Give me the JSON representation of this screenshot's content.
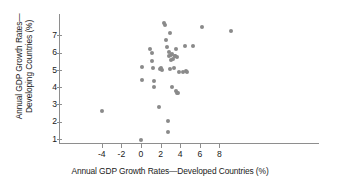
{
  "chart_data": {
    "type": "scatter",
    "title": "",
    "xlabel": "Annual GDP Growth Rates—Developed Countries (%)",
    "ylabel_line1": "Annual GDP Growth Rates—",
    "ylabel_line2": "Developing Countries (%)",
    "ylabel": "Annual GDP Growth Rates—Developing Countries (%)",
    "xlim": [
      -5.0,
      10.2
    ],
    "ylim": [
      0.55,
      8.1
    ],
    "xticks": [
      -4,
      -2,
      0,
      2,
      4,
      6,
      8
    ],
    "yticks": [
      1,
      2,
      3,
      4,
      5,
      6,
      7
    ],
    "xtick_labels": [
      "-4",
      "-2",
      "0",
      "2",
      "4",
      "6",
      "8"
    ],
    "ytick_labels": [
      "1",
      "2",
      "3",
      "4",
      "5",
      "6",
      "7"
    ],
    "grid": false,
    "legend": "none",
    "marker_color": "#8a8a8a",
    "axis_color": "#8e8e8e",
    "marker_size_px": 4,
    "points": [
      [
        -4.0,
        2.65
      ],
      [
        0.0,
        0.95
      ],
      [
        0.05,
        5.18
      ],
      [
        0.1,
        4.42
      ],
      [
        0.9,
        6.18
      ],
      [
        1.1,
        5.95
      ],
      [
        1.15,
        5.52
      ],
      [
        1.2,
        5.1
      ],
      [
        1.3,
        4.35
      ],
      [
        1.35,
        4.0
      ],
      [
        1.8,
        2.88
      ],
      [
        1.9,
        5.05
      ],
      [
        2.0,
        5.12
      ],
      [
        2.15,
        5.02
      ],
      [
        2.35,
        7.72
      ],
      [
        2.45,
        7.58
      ],
      [
        2.5,
        6.72
      ],
      [
        2.6,
        6.3
      ],
      [
        2.7,
        2.05
      ],
      [
        2.8,
        1.4
      ],
      [
        2.85,
        6.02
      ],
      [
        2.9,
        5.78
      ],
      [
        2.95,
        5.05
      ],
      [
        3.0,
        7.12
      ],
      [
        3.05,
        5.55
      ],
      [
        3.1,
        5.85
      ],
      [
        3.15,
        3.98
      ],
      [
        3.2,
        5.9
      ],
      [
        3.3,
        5.62
      ],
      [
        3.35,
        5.1
      ],
      [
        3.45,
        5.78
      ],
      [
        3.5,
        5.82
      ],
      [
        3.55,
        3.78
      ],
      [
        3.6,
        6.2
      ],
      [
        3.65,
        5.75
      ],
      [
        3.7,
        3.68
      ],
      [
        3.8,
        3.68
      ],
      [
        3.85,
        4.88
      ],
      [
        4.3,
        4.88
      ],
      [
        4.5,
        6.38
      ],
      [
        4.55,
        4.95
      ],
      [
        4.65,
        4.85
      ],
      [
        5.3,
        6.38
      ],
      [
        6.2,
        7.48
      ],
      [
        9.2,
        7.22
      ]
    ]
  }
}
